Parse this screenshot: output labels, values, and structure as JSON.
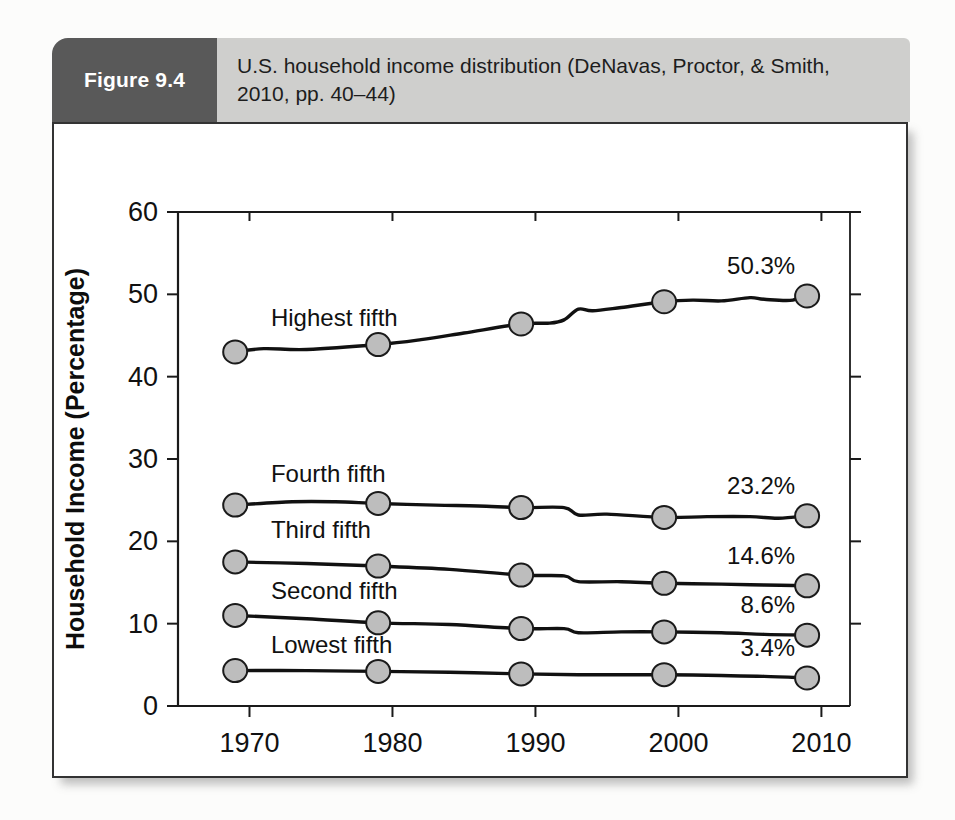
{
  "figure": {
    "badge_label": "Figure 9.4",
    "title": "U.S. household income distribution (DeNavas, Proctor, & Smith, 2010, pp. 40–44)",
    "badge_color": "#595959",
    "title_bar_color": "#cfcfcd"
  },
  "chart_data": {
    "type": "line",
    "title": "U.S. household income distribution (DeNavas, Proctor, & Smith, 2010, pp. 40–44)",
    "xlabel": "Year",
    "ylabel": "Household Income (Percentage)",
    "xlim": [
      1965,
      2012
    ],
    "ylim": [
      0,
      60
    ],
    "x_ticks": [
      1970,
      1980,
      1990,
      2000,
      2010
    ],
    "x_tick_labels": [
      "1970",
      "1980",
      "1990",
      "2000",
      "2010"
    ],
    "y_ticks": [
      0,
      10,
      20,
      30,
      40,
      50,
      60
    ],
    "y_tick_labels": [
      "0",
      "10",
      "20",
      "30",
      "40",
      "50",
      "60"
    ],
    "grid": false,
    "legend": "inline-labels",
    "marker_years": [
      1969,
      1979,
      1989,
      1999,
      2009
    ],
    "series": [
      {
        "name": "Highest fifth",
        "label_x": 1971.5,
        "label_y": 46.2,
        "end_label": "50.3%",
        "marker_values": [
          43.0,
          43.9,
          46.4,
          49.1,
          49.8
        ],
        "x": [
          1969,
          1971,
          1974,
          1979,
          1982,
          1985,
          1989,
          1991,
          1992,
          1993,
          1994,
          1996,
          1999,
          2001,
          2003,
          2005,
          2006,
          2008,
          2009
        ],
        "values": [
          43.0,
          43.4,
          43.3,
          43.9,
          44.5,
          45.3,
          46.4,
          46.5,
          46.9,
          48.2,
          48.0,
          48.4,
          49.1,
          49.3,
          49.2,
          49.6,
          49.4,
          49.3,
          50.3
        ]
      },
      {
        "name": "Fourth fifth",
        "label_x": 1971.5,
        "label_y": 27.2,
        "end_label": "23.2%",
        "marker_values": [
          24.4,
          24.6,
          24.1,
          22.9,
          23.1
        ],
        "x": [
          1969,
          1973,
          1976,
          1979,
          1983,
          1986,
          1989,
          1992,
          1993,
          1995,
          1999,
          2002,
          2005,
          2007,
          2009
        ],
        "values": [
          24.4,
          24.8,
          24.8,
          24.6,
          24.4,
          24.3,
          24.1,
          24.1,
          23.2,
          23.3,
          22.9,
          23.0,
          23.0,
          22.8,
          23.1
        ]
      },
      {
        "name": "Third fifth",
        "label_x": 1971.5,
        "label_y": 20.4,
        "end_label": "14.6%",
        "marker_values": [
          17.5,
          17.0,
          15.9,
          14.9,
          14.6
        ],
        "x": [
          1969,
          1974,
          1979,
          1984,
          1989,
          1992,
          1993,
          1996,
          1999,
          2003,
          2006,
          2009
        ],
        "values": [
          17.5,
          17.3,
          17.0,
          16.6,
          15.9,
          15.8,
          15.1,
          15.1,
          14.9,
          14.8,
          14.7,
          14.6
        ]
      },
      {
        "name": "Second fifth",
        "label_x": 1971.5,
        "label_y": 13.0,
        "end_label": "8.6%",
        "marker_values": [
          11.0,
          10.1,
          9.4,
          9.0,
          8.6
        ],
        "x": [
          1969,
          1974,
          1979,
          1984,
          1989,
          1992,
          1993,
          1996,
          1999,
          2003,
          2006,
          2009
        ],
        "values": [
          11.0,
          10.6,
          10.1,
          9.9,
          9.4,
          9.4,
          8.9,
          9.0,
          9.0,
          8.9,
          8.7,
          8.6
        ]
      },
      {
        "name": "Lowest fifth",
        "label_x": 1971.5,
        "label_y": 6.4,
        "end_label": "3.4%",
        "marker_values": [
          4.3,
          4.2,
          3.9,
          3.8,
          3.4
        ],
        "x": [
          1969,
          1974,
          1979,
          1984,
          1989,
          1993,
          1996,
          1999,
          2003,
          2006,
          2009
        ],
        "values": [
          4.3,
          4.3,
          4.2,
          4.1,
          3.9,
          3.8,
          3.8,
          3.8,
          3.7,
          3.6,
          3.4
        ]
      }
    ]
  }
}
